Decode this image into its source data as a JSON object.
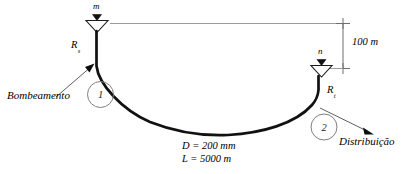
{
  "diagram": {
    "language": "pt-BR",
    "colors": {
      "pipe": "#111111",
      "reference_line": "#9a9a9a",
      "dimension_line": "#6e6e6e",
      "node_circle": "#7a7a7a",
      "text": "#000000",
      "background": "#ffffff"
    },
    "labels": {
      "source_level": "m",
      "discharge_level": "n",
      "source_reservoir": "R",
      "source_reservoir_sub": "s",
      "target_reservoir": "R",
      "target_reservoir_sub": "t",
      "pumping": "Bombeamento",
      "distribution": "Distribuição",
      "elevation": "100 m",
      "diameter": "D = 200 mm",
      "length": "L = 5000 m",
      "node_1": "1",
      "node_2": "2"
    },
    "values": {
      "elevation_difference_m": 100,
      "pipe_diameter_mm": 200,
      "pipe_length_m": 5000
    },
    "icons": {
      "free_surface_left": "water-surface-triangle-icon",
      "free_surface_right": "water-surface-triangle-icon",
      "level_marker_m": "level-marker-filled-triangle-icon",
      "level_marker_n": "level-marker-filled-triangle-icon",
      "pumping_arrow": "arrow-to-pump-icon",
      "distribution_arrow": "arrow-to-distribution-icon",
      "dimension_tick_top": "dimension-tick-icon",
      "dimension_tick_bottom": "dimension-tick-icon"
    }
  }
}
